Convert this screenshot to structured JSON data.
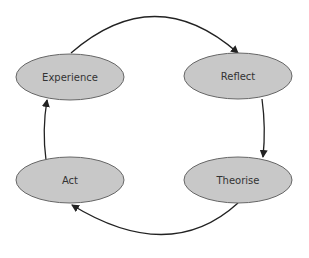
{
  "diagram": {
    "type": "cycle",
    "nodes": [
      {
        "id": "experience",
        "label": "Experience"
      },
      {
        "id": "reflect",
        "label": "Reflect"
      },
      {
        "id": "theorise",
        "label": "Theorise"
      },
      {
        "id": "act",
        "label": "Act"
      }
    ],
    "edges": [
      {
        "from": "experience",
        "to": "reflect"
      },
      {
        "from": "reflect",
        "to": "theorise"
      },
      {
        "from": "theorise",
        "to": "act"
      },
      {
        "from": "act",
        "to": "experience"
      }
    ],
    "colors": {
      "node_fill": "#c8c8c8",
      "node_stroke": "#666666",
      "edge": "#222222",
      "text": "#333333"
    }
  }
}
